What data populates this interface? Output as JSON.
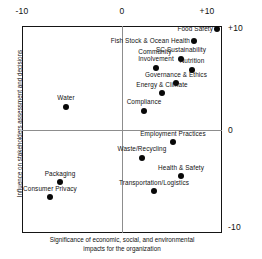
{
  "chart_data": {
    "type": "scatter",
    "title": "",
    "xlabel": "Significance of economic, social, and environmental impacts for the organization",
    "ylabel": "Influence on stakeholders assessment and decisions",
    "xlim": [
      -10,
      10
    ],
    "ylim": [
      -10,
      10
    ],
    "xticks": [
      "-10",
      "0",
      "+10"
    ],
    "yticks": [
      "+10",
      "0",
      "-10"
    ],
    "grid": false,
    "legend": "none",
    "zero_lines": true,
    "points": [
      {
        "label": "Food Safety",
        "x": 9.5,
        "y": 9.9,
        "label_side": "left"
      },
      {
        "label": "Fish Stock & Ocean Health",
        "x": 7.2,
        "y": 8.7,
        "label_side": "left"
      },
      {
        "label": "SC Sustainability",
        "x": 5.9,
        "y": 7.0,
        "label_side": "center"
      },
      {
        "label": "Community\nInvolvement",
        "x": 3.4,
        "y": 6.1,
        "label_side": "center"
      },
      {
        "label": "Nutrition",
        "x": 7.0,
        "y": 5.9,
        "label_side": "center"
      },
      {
        "label": "Governance & Ethics",
        "x": 5.4,
        "y": 4.6,
        "label_side": "center"
      },
      {
        "label": "Energy & Climate",
        "x": 4.0,
        "y": 3.6,
        "label_side": "center"
      },
      {
        "label": "Compliance",
        "x": 2.2,
        "y": 1.9,
        "label_side": "center"
      },
      {
        "label": "Water",
        "x": -5.6,
        "y": 2.3,
        "label_side": "center"
      },
      {
        "label": "Employment Practices",
        "x": 5.1,
        "y": -1.2,
        "label_side": "center"
      },
      {
        "label": "Waste/Recycling",
        "x": 2.0,
        "y": -2.7,
        "label_side": "center"
      },
      {
        "label": "Health & Safety",
        "x": 5.9,
        "y": -4.5,
        "label_side": "center"
      },
      {
        "label": "Transportation/Logistics",
        "x": 3.2,
        "y": -6.0,
        "label_side": "center"
      },
      {
        "label": "Packaging",
        "x": -6.2,
        "y": -5.1,
        "label_side": "center"
      },
      {
        "label": "Consumer Privacy",
        "x": -7.2,
        "y": -6.6,
        "label_side": "center"
      }
    ]
  },
  "axes": {
    "x_tick_left": "-10",
    "x_tick_center": "0",
    "x_tick_right": "+10",
    "y_tick_top": "+10",
    "y_tick_middle": "0",
    "y_tick_bottom": "-10",
    "x_caption_line1": "Significance of economic, social, and environmental",
    "x_caption_line2": "impacts for the organization",
    "y_caption": "Influence on stakeholders assessment and decisions"
  },
  "style": {
    "frame_color": "#151515",
    "zero_line_color": "#8d8d8d",
    "point_color": "#080808",
    "text_color": "#111111",
    "background": "#ffffff"
  }
}
